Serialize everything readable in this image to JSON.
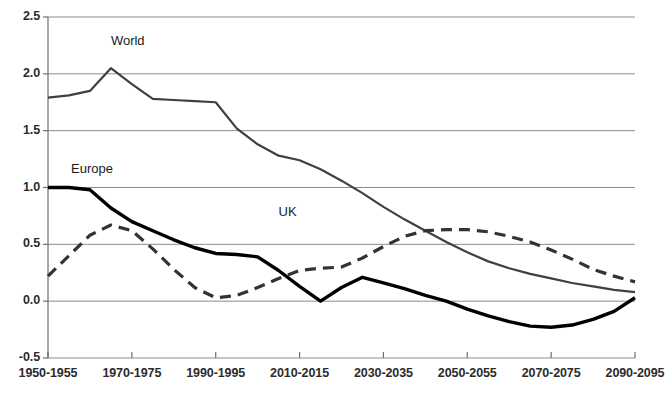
{
  "chart_data": {
    "type": "line",
    "title": "",
    "subtitle": "",
    "xlabel": "",
    "ylabel": "",
    "grid": true,
    "legend_position": "inline-labels",
    "xlim": [
      0,
      29
    ],
    "ylim": [
      -0.5,
      2.5
    ],
    "y_ticks": [
      "2.5",
      "2.0",
      "1.5",
      "1.0",
      "0.5",
      "0.0",
      "-0.5"
    ],
    "y_tick_values": [
      2.5,
      2.0,
      1.5,
      1.0,
      0.5,
      0.0,
      -0.5
    ],
    "x_tick_labels": [
      "1950-1955",
      "1970-1975",
      "1990-1995",
      "2010-2015",
      "2030-2035",
      "2050-2055",
      "2070-2075",
      "2090-2095"
    ],
    "x_tick_indices": [
      0,
      4,
      8,
      12,
      16,
      20,
      24,
      28
    ],
    "categories": [
      "1950-1955",
      "1955-1960",
      "1960-1965",
      "1965-1970",
      "1970-1975",
      "1975-1980",
      "1980-1985",
      "1985-1990",
      "1990-1995",
      "1995-2000",
      "2000-2005",
      "2005-2010",
      "2010-2015",
      "2015-2020",
      "2020-2025",
      "2025-2030",
      "2030-2035",
      "2035-2040",
      "2040-2045",
      "2045-2050",
      "2050-2055",
      "2055-2060",
      "2060-2065",
      "2065-2070",
      "2070-2075",
      "2075-2080",
      "2080-2085",
      "2085-2090",
      "2090-2095"
    ],
    "series": [
      {
        "name": "World",
        "label": "World",
        "style": "solid",
        "color": "#404040",
        "width": 2.2,
        "values": [
          1.79,
          1.81,
          1.85,
          2.05,
          1.91,
          1.78,
          1.77,
          1.76,
          1.75,
          1.52,
          1.38,
          1.28,
          1.24,
          1.16,
          1.06,
          0.95,
          0.83,
          0.72,
          0.62,
          0.52,
          0.43,
          0.35,
          0.29,
          0.24,
          0.2,
          0.16,
          0.13,
          0.1,
          0.08
        ]
      },
      {
        "name": "Europe",
        "label": "Europe",
        "style": "solid",
        "color": "#000000",
        "width": 3.4,
        "values": [
          1.0,
          1.0,
          0.98,
          0.82,
          0.7,
          0.62,
          0.54,
          0.47,
          0.42,
          0.41,
          0.39,
          0.27,
          0.13,
          0.0,
          0.12,
          0.21,
          0.16,
          0.11,
          0.05,
          0.0,
          -0.07,
          -0.13,
          -0.18,
          -0.22,
          -0.23,
          -0.21,
          -0.16,
          -0.09,
          0.03
        ]
      },
      {
        "name": "UK",
        "label": "UK",
        "style": "dashed",
        "color": "#333333",
        "width": 3.2,
        "values": [
          0.22,
          0.4,
          0.58,
          0.67,
          0.62,
          0.46,
          0.28,
          0.12,
          0.03,
          0.05,
          0.12,
          0.2,
          0.27,
          0.29,
          0.3,
          0.38,
          0.48,
          0.57,
          0.62,
          0.63,
          0.63,
          0.61,
          0.57,
          0.52,
          0.45,
          0.37,
          0.28,
          0.22,
          0.17
        ]
      }
    ],
    "annotations": [
      {
        "text": "World",
        "x_index": 3.0,
        "y_value": 2.28
      },
      {
        "text": "Europe",
        "x_index": 1.1,
        "y_value": 1.15
      },
      {
        "text": "UK",
        "x_index": 11.0,
        "y_value": 0.78
      }
    ]
  },
  "colors": {
    "grid": "#8c8c8c",
    "axis": "#6e6e6e",
    "text": "#2b2b2b",
    "background": "#ffffff"
  }
}
